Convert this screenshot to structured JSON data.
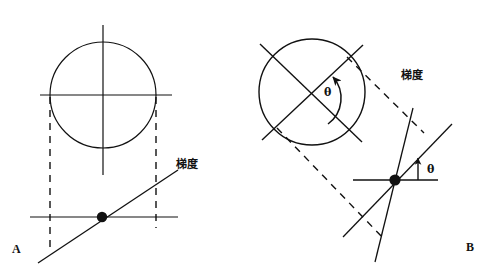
{
  "figure": {
    "background_color": "#ffffff",
    "stroke_color": "#111111",
    "width": 491,
    "height": 270
  },
  "panels": [
    {
      "id": "A",
      "label": "A",
      "description": "Unrotated circle with axis crosshair, dashed projection lines and gradient line through marked point",
      "gradient_label": "梯度",
      "circle": {
        "cx": 103,
        "cy": 95,
        "r": 53
      },
      "baseline_y": 217,
      "point": {
        "x": 102,
        "y": 217
      },
      "dashed_x": [
        50,
        156
      ]
    },
    {
      "id": "B",
      "label": "B",
      "description": "Rotated circle with tilted crosshair, rotation angle theta, dashed projection parallelogram and gradient line at angle theta above horizontal",
      "gradient_label": "梯度",
      "angle_label_rotation": "θ",
      "angle_label_slope": "θ",
      "circle": {
        "cx": 312,
        "cy": 92,
        "r": 53
      },
      "baseline_y": 180,
      "point": {
        "x": 395,
        "y": 180
      },
      "rotation_degrees": 45
    }
  ],
  "labels": {
    "panel_a": "A",
    "panel_b": "B",
    "gradient_a": "梯度",
    "gradient_b": "梯度",
    "theta_rotation": "θ",
    "theta_slope": "θ"
  }
}
